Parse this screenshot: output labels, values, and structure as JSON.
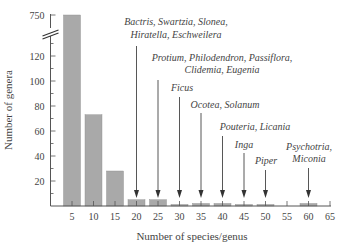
{
  "chart_data": {
    "type": "bar",
    "title": "",
    "xlabel": "Number of species/genus",
    "ylabel": "Number of genera",
    "categories": [
      5,
      10,
      15,
      20,
      25,
      30,
      35,
      40,
      45,
      50,
      55,
      60
    ],
    "values": [
      750,
      73,
      28,
      5,
      5,
      1,
      2,
      2,
      1,
      1,
      0,
      2
    ],
    "x_ticks": [
      "5",
      "10",
      "15",
      "20",
      "25",
      "30",
      "35",
      "40",
      "45",
      "50",
      "55",
      "60",
      "65"
    ],
    "y_ticks": [
      "20",
      "40",
      "60",
      "80",
      "100",
      "120",
      "750"
    ],
    "y_axis_break": {
      "between": [
        120,
        750
      ]
    },
    "ylim": [
      0,
      750
    ],
    "xlim": [
      0,
      65
    ],
    "grid": false,
    "legend": null,
    "bar_color": "#a9a9a9",
    "annotations": [
      {
        "x": 20,
        "lines": [
          "Bactris, Swartzia, Sloneа,",
          "Hiratella, Eschweilera"
        ]
      },
      {
        "x": 25,
        "lines": [
          "Protium, Philodendron, Passiflora,",
          "Clidemia, Eugenia"
        ]
      },
      {
        "x": 30,
        "lines": [
          "Ficus"
        ]
      },
      {
        "x": 35,
        "lines": [
          "Ocotea, Solanum"
        ]
      },
      {
        "x": 40,
        "lines": [
          "Pouteria, Licania"
        ]
      },
      {
        "x": 45,
        "lines": [
          "Inga"
        ]
      },
      {
        "x": 50,
        "lines": [
          "Piper"
        ]
      },
      {
        "x": 60,
        "lines": [
          "Psychotria,",
          "Miconia"
        ]
      }
    ]
  }
}
